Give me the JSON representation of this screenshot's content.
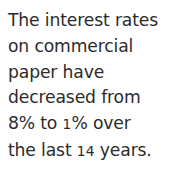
{
  "document": {
    "type": "text-statement",
    "background_color": "#ffffff",
    "text_color": "#2b2b2b",
    "full_text": "The interest rates on commercial paper have decreased from 8% to 1% over the last 14 years.",
    "lines": [
      {
        "text": "The interest rates"
      },
      {
        "text": "on commercial"
      },
      {
        "text": "paper have"
      },
      {
        "text": "decreased from"
      },
      {
        "before": "8% to ",
        "figure": "1",
        "after": "% over"
      },
      {
        "before": "the last ",
        "figure": "14",
        "after": " years."
      }
    ],
    "values": {
      "rate_start": "8%",
      "rate_end": "1%",
      "period_years": "14",
      "subject": "commercial paper",
      "trend": "decreased"
    }
  }
}
